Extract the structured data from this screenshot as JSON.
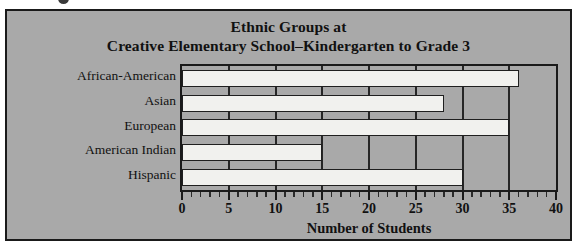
{
  "chart_data": {
    "type": "bar",
    "orientation": "horizontal",
    "title": "Ethnic Groups at Creative Elementary School–Kindergarten to Grade 3",
    "title_lines": [
      "Ethnic Groups at",
      "Creative Elementary School–Kindergarten to Grade 3"
    ],
    "categories": [
      "African-American",
      "Asian",
      "European",
      "American Indian",
      "Hispanic"
    ],
    "values": [
      36,
      28,
      35,
      15,
      30
    ],
    "xlabel": "Number of Students",
    "ylabel": "",
    "xlim": [
      0,
      40
    ],
    "xticks": [
      0,
      5,
      10,
      15,
      20,
      25,
      30,
      35,
      40
    ],
    "xtick_labels": [
      "0",
      "5",
      "10",
      "15",
      "20",
      "25",
      "30",
      "35",
      "40"
    ],
    "minor_tick_step": 1,
    "grid": "vertical-major",
    "legend": "none"
  },
  "style": {
    "figure_background": "#a9a9a9",
    "bar_fill": "#f1f1ee",
    "bar_border": "#1f1f1f",
    "frame_color": "#1a1a1a",
    "text_color": "#111111",
    "gridline_color": "#262626"
  }
}
